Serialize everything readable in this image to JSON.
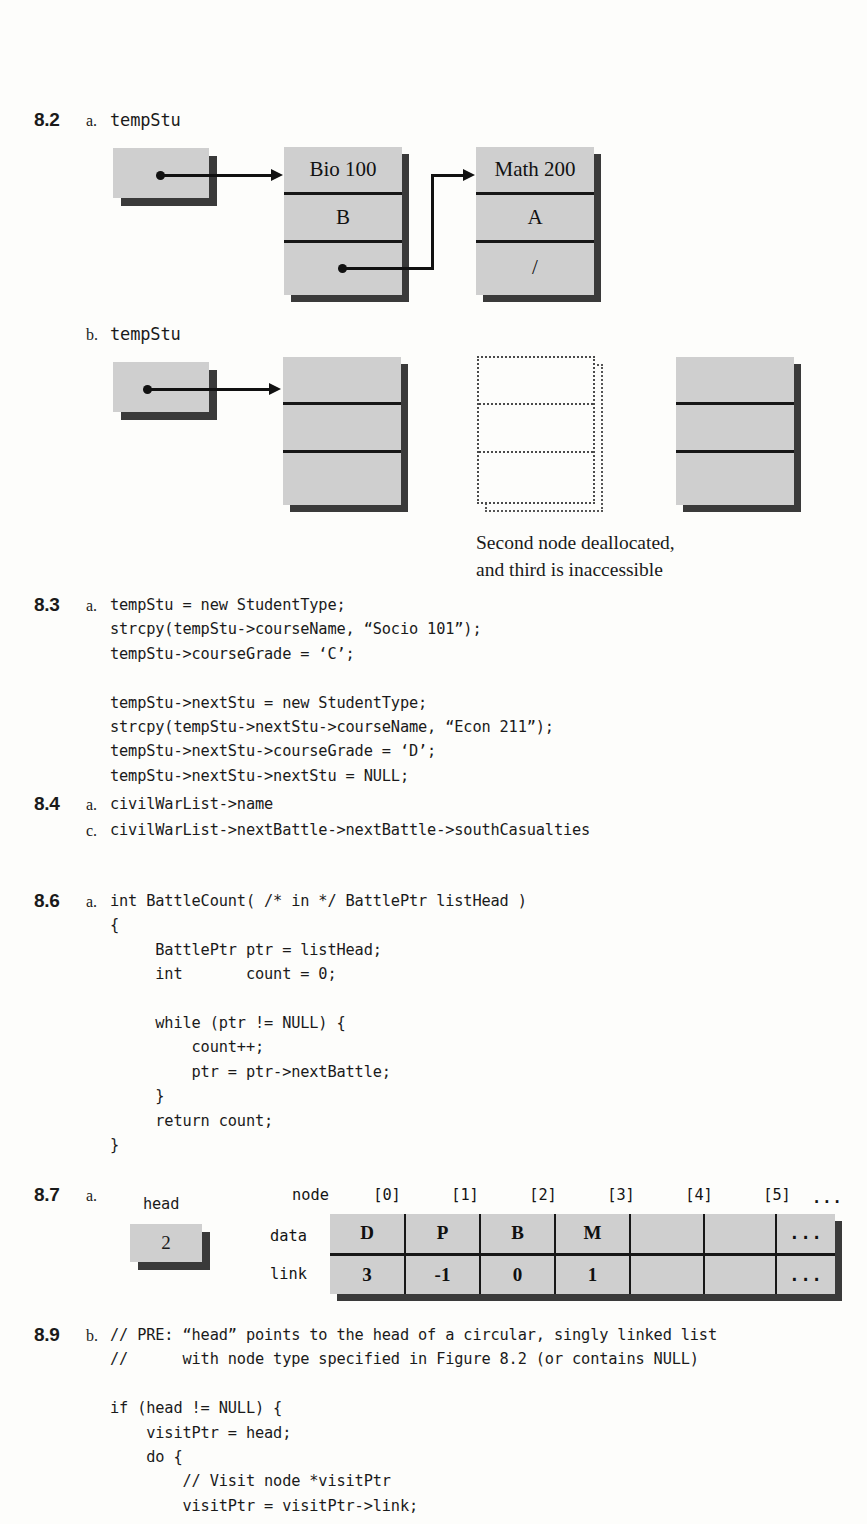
{
  "exercises": {
    "e82": {
      "number": "8.2",
      "parts": [
        {
          "letter": "a.",
          "label": "tempStu"
        },
        {
          "letter": "b.",
          "label": "tempStu"
        }
      ],
      "diagram_a": {
        "nodes": [
          {
            "name": "bio-node",
            "cells": [
              "Bio 100",
              "B",
              ""
            ]
          },
          {
            "name": "math-node",
            "cells": [
              "Math 200",
              "A",
              "/"
            ]
          }
        ]
      },
      "diagram_b": {
        "nodes": [
          {
            "name": "first-node",
            "cells": [
              "",
              "",
              ""
            ]
          },
          {
            "name": "deallocated-node",
            "cells": [
              "",
              "",
              ""
            ]
          },
          {
            "name": "inaccessible-node",
            "cells": [
              "",
              "",
              ""
            ]
          }
        ],
        "caption": "Second node deallocated,\nand third is inaccessible"
      }
    },
    "e83": {
      "number": "8.3",
      "part_letter": "a.",
      "code": "tempStu = new StudentType;\nstrcpy(tempStu->courseName, “Socio 101”);\ntempStu->courseGrade = ‘C’;\n\ntempStu->nextStu = new StudentType;\nstrcpy(tempStu->nextStu->courseName, “Econ 211”);\ntempStu->nextStu->courseGrade = ‘D’;\ntempStu->nextStu->nextStu = NULL;"
    },
    "e84": {
      "number": "8.4",
      "lines": [
        {
          "letter": "a.",
          "code": "civilWarList->name"
        },
        {
          "letter": "c.",
          "code": "civilWarList->nextBattle->nextBattle->southCasualties"
        }
      ]
    },
    "e86": {
      "number": "8.6",
      "part_letter": "a.",
      "code": "int BattleCount( /* in */ BattlePtr listHead )\n{\n     BattlePtr ptr = listHead;\n     int       count = 0;\n\n     while (ptr != NULL) {\n         count++;\n         ptr = ptr->nextBattle;\n     }\n     return count;\n}"
    },
    "e87": {
      "number": "8.7",
      "part_letter": "a.",
      "head_label": "head",
      "head_value": "2",
      "table": {
        "corner_label": "node",
        "columns": [
          "[0]",
          "[1]",
          "[2]",
          "[3]",
          "[4]",
          "[5]",
          "..."
        ],
        "rows": [
          {
            "label": "data",
            "values": [
              "D",
              "P",
              "B",
              "M",
              "",
              "",
              "..."
            ]
          },
          {
            "label": "link",
            "values": [
              "3",
              "-1",
              "0",
              "1",
              "",
              "",
              "..."
            ]
          }
        ]
      }
    },
    "e89": {
      "number": "8.9",
      "part_letter": "b.",
      "code": "// PRE: “head” points to the head of a circular, singly linked list\n//      with node type specified in Figure 8.2 (or contains NULL)\n\nif (head != NULL) {\n    visitPtr = head;\n    do {\n        // Visit node *visitPtr\n        visitPtr = visitPtr->link;"
    }
  },
  "colors": {
    "node_fill": "#cfcfcf",
    "node_shadow": "#3a3a3a",
    "rule": "#171717",
    "ink": "#111111",
    "paper": "#fdfdfb"
  }
}
